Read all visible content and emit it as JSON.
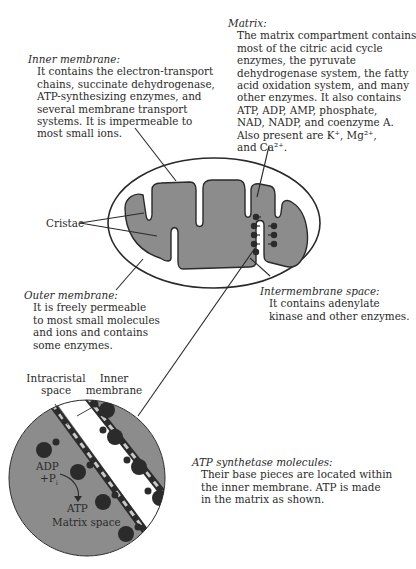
{
  "labels": {
    "inner_membrane": {
      "title": "Inner membrane:",
      "lines": [
        "It contains the electron-transport",
        "chains, succinate dehydrogenase,",
        "ATP-synthesizing enzymes, and",
        "several membrane transport",
        "systems. It is impermeable to",
        "most small ions."
      ]
    },
    "matrix": {
      "title": "Matrix:",
      "lines": [
        "The matrix compartment contains",
        "most of the citric acid cycle",
        "enzymes, the pyruvate",
        "dehydrogenase system, the fatty",
        "acid oxidation system, and many",
        "other enzymes. It also contains",
        "ATP, ADP, AMP, phosphate,",
        "NAD,  NADP, and coenzyme A.",
        "Also present are K⁺, Mg²⁺,",
        "and Ca²⁺."
      ]
    },
    "cristae": "Cristae",
    "outer_membrane": {
      "title": "Outer membrane:",
      "lines": [
        "It is freely permeable",
        "to most small molecules",
        "and ions and contains",
        "some enzymes."
      ]
    },
    "intermembrane_space": {
      "title": "Intermembrane space:",
      "lines": [
        "It contains adenylate",
        "kinase and other enzymes."
      ]
    },
    "atp_synthetase": {
      "title": "ATP synthetase molecules:",
      "lines": [
        "Their base pieces are located within",
        "the inner membrane. ATP is made",
        "in the matrix as shown."
      ]
    }
  },
  "inset": {
    "intracristal_space": [
      "Intracristal",
      "space"
    ],
    "inner_membrane": [
      "Inner",
      "membrane"
    ],
    "adp": "ADP",
    "pi": "+P",
    "pi_sub": "i",
    "atp": "ATP",
    "matrix_space": "Matrix space"
  },
  "colors": {
    "matrix_fill": "#8c8c8c",
    "line": "#2a2a2a",
    "particle": "#2b2b2b",
    "membrane_light": "#c8c8c8"
  }
}
